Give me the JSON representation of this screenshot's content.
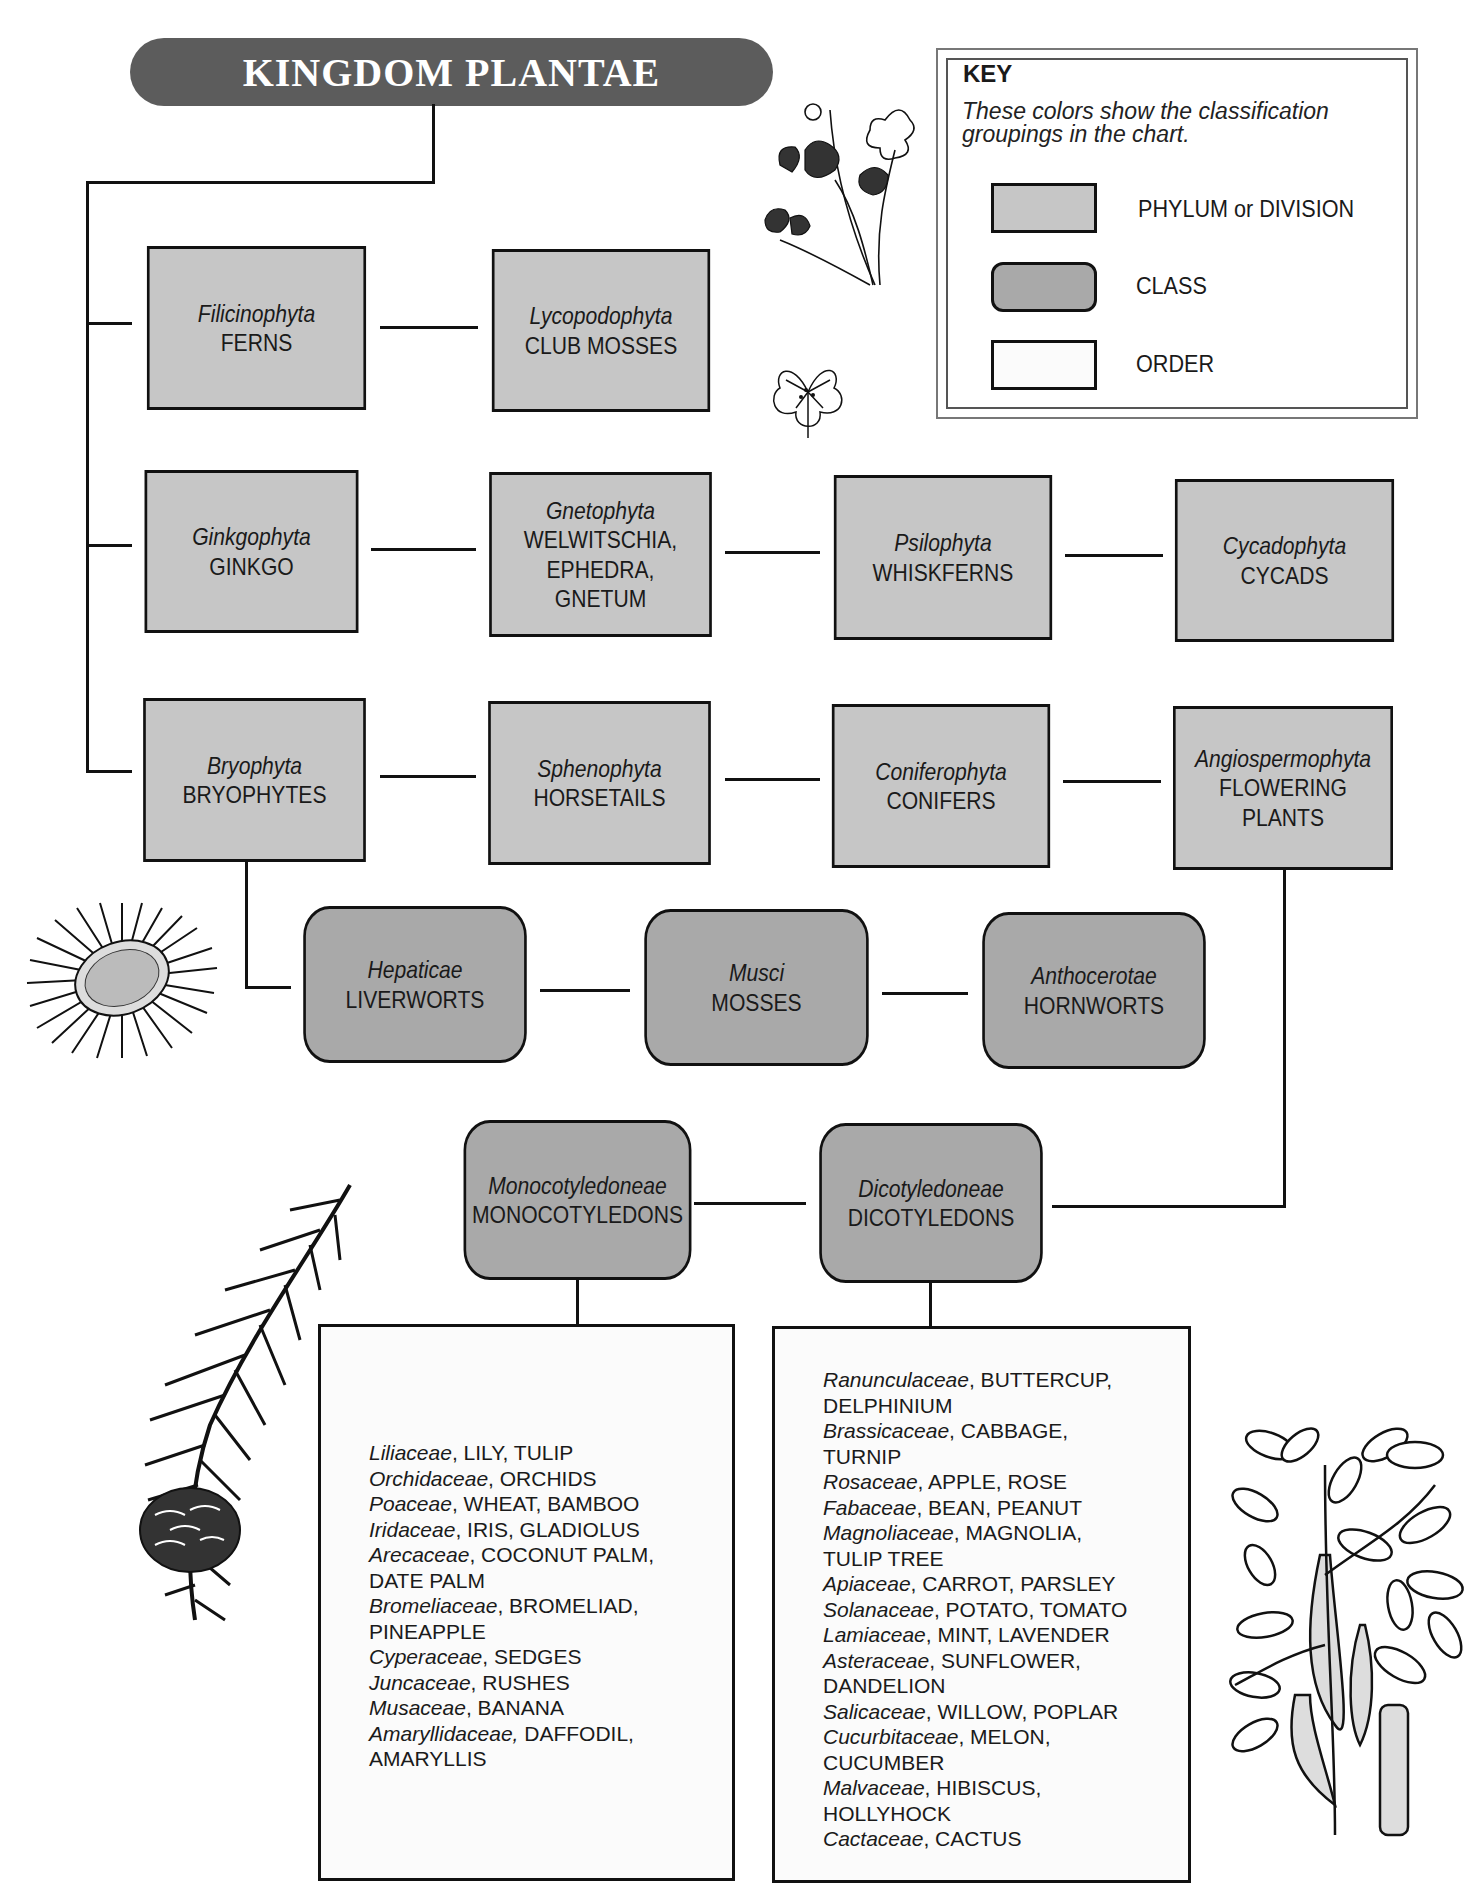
{
  "title": "KINGDOM PLANTAE",
  "key": {
    "heading": "KEY",
    "description": "These colors show the classification groupings in the chart.",
    "items": [
      {
        "label": "PHYLUM or DIVISION",
        "color": "#c6c6c6",
        "shape": "rectangle"
      },
      {
        "label": "CLASS",
        "color": "#a9a9a9",
        "shape": "rounded-rectangle"
      },
      {
        "label": "ORDER",
        "color": "#fbfbfb",
        "shape": "rectangle"
      }
    ]
  },
  "phyla": [
    {
      "scientific": "Filicinophyta",
      "common": "FERNS"
    },
    {
      "scientific": "Lycopodophyta",
      "common": "CLUB MOSSES"
    },
    {
      "scientific": "Ginkgophyta",
      "common": "GINKGO"
    },
    {
      "scientific": "Gnetophyta",
      "common": "WELWITSCHIA, EPHEDRA, GNETUM",
      "lines": [
        "WELWITSCHIA,",
        "EPHEDRA,",
        "GNETUM"
      ]
    },
    {
      "scientific": "Psilophyta",
      "common": "WHISKFERNS"
    },
    {
      "scientific": "Cycadophyta",
      "common": "CYCADS"
    },
    {
      "scientific": "Bryophyta",
      "common": "BRYOPHYTES"
    },
    {
      "scientific": "Sphenophyta",
      "common": "HORSETAILS"
    },
    {
      "scientific": "Coniferophyta",
      "common": "CONIFERS"
    },
    {
      "scientific": "Angiospermophyta",
      "common": "FLOWERING PLANTS",
      "lines": [
        "FLOWERING",
        "PLANTS"
      ]
    }
  ],
  "classes": [
    {
      "scientific": "Hepaticae",
      "common": "LIVERWORTS",
      "parent": "Bryophyta"
    },
    {
      "scientific": "Musci",
      "common": "MOSSES",
      "parent": "Bryophyta"
    },
    {
      "scientific": "Anthocerotae",
      "common": "HORNWORTS",
      "parent": "Bryophyta"
    },
    {
      "scientific": "Monocotyledoneae",
      "common": "MONOCOTYLEDONS",
      "parent": "Angiospermophyta"
    },
    {
      "scientific": "Dicotyledoneae",
      "common": "DICOTYLEDONS",
      "parent": "Angiospermophyta"
    }
  ],
  "orders": {
    "monocots": [
      {
        "family": "Liliaceae",
        "common": ", LILY, TULIP"
      },
      {
        "family": "Orchidaceae",
        "common": ", ORCHIDS"
      },
      {
        "family": "Poaceae",
        "common": ", WHEAT, BAMBOO"
      },
      {
        "family": "Iridaceae",
        "common": ", IRIS, GLADIOLUS"
      },
      {
        "family": "Arecaceae",
        "common": ", COCONUT PALM,",
        "cont": "DATE PALM"
      },
      {
        "family": "Bromeliaceae",
        "common": ", BROMELIAD,",
        "cont": "PINEAPPLE"
      },
      {
        "family": "Cyperaceae",
        "common": ", SEDGES"
      },
      {
        "family": "Juncaceae",
        "common": ", RUSHES"
      },
      {
        "family": "Musaceae",
        "common": ", BANANA"
      },
      {
        "family": "Amaryllidaceae,",
        "common": " DAFFODIL,",
        "cont": "AMARYLLIS"
      }
    ],
    "dicots": [
      {
        "family": "Ranunculaceae",
        "common": ", BUTTERCUP,",
        "cont": "DELPHINIUM"
      },
      {
        "family": "Brassicaceae",
        "common": ", CABBAGE,",
        "cont": "TURNIP"
      },
      {
        "family": "Rosaceae",
        "common": ", APPLE, ROSE"
      },
      {
        "family": "Fabaceae",
        "common": ", BEAN, PEANUT"
      },
      {
        "family": "Magnoliaceae",
        "common": ", MAGNOLIA,",
        "cont": "TULIP TREE"
      },
      {
        "family": "Apiaceae",
        "common": ", CARROT, PARSLEY"
      },
      {
        "family": "Solanaceae",
        "common": ", POTATO, TOMATO"
      },
      {
        "family": "Lamiaceae",
        "common": ", MINT, LAVENDER"
      },
      {
        "family": "Asteraceae",
        "common": ", SUNFLOWER,",
        "cont": "DANDELION"
      },
      {
        "family": "Salicaceae",
        "common": ", WILLOW, POPLAR"
      },
      {
        "family": "Cucurbitaceae",
        "common": ", MELON,",
        "cont": "CUCUMBER"
      },
      {
        "family": "Malvaceae",
        "common": ", HIBISCUS,",
        "cont": "HOLLYHOCK"
      },
      {
        "family": "Cactaceae",
        "common": ", CACTUS"
      }
    ]
  },
  "illustrations": [
    "wood-sorrel-plant",
    "clover-leaf",
    "moss-rosette",
    "conifer-branch",
    "leafy-bean-branch"
  ]
}
